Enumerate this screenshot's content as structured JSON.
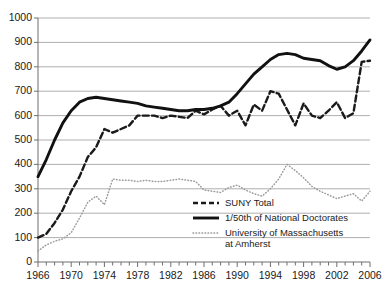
{
  "chart_data": {
    "type": "line",
    "title": "",
    "xlabel": "",
    "ylabel": "",
    "xlim": [
      1966,
      2006
    ],
    "ylim": [
      0,
      1000
    ],
    "grid": true,
    "legend_position": "bottom-right",
    "ytick_labels": [
      "0",
      "100",
      "200",
      "300",
      "400",
      "500",
      "600",
      "700",
      "800",
      "900",
      "1000"
    ],
    "ytick_values": [
      0,
      100,
      200,
      300,
      400,
      500,
      600,
      700,
      800,
      900,
      1000
    ],
    "xtick_labels": [
      "1966",
      "1970",
      "1974",
      "1978",
      "1982",
      "1986",
      "1990",
      "1994",
      "1998",
      "2002",
      "2006"
    ],
    "xtick_values": [
      1966,
      1970,
      1974,
      1978,
      1982,
      1986,
      1990,
      1994,
      1998,
      2002,
      2006
    ],
    "x": [
      1966,
      1967,
      1968,
      1969,
      1970,
      1971,
      1972,
      1973,
      1974,
      1975,
      1976,
      1977,
      1978,
      1979,
      1980,
      1981,
      1982,
      1983,
      1984,
      1985,
      1986,
      1987,
      1988,
      1989,
      1990,
      1991,
      1992,
      1993,
      1994,
      1995,
      1996,
      1997,
      1998,
      1999,
      2000,
      2001,
      2002,
      2003,
      2004,
      2005,
      2006
    ],
    "series": [
      {
        "name": "SUNY Total",
        "style": "dashed",
        "color": "#1a1a1a",
        "values": [
          100,
          115,
          160,
          215,
          290,
          350,
          430,
          470,
          545,
          530,
          545,
          560,
          600,
          600,
          600,
          590,
          600,
          595,
          590,
          620,
          605,
          625,
          640,
          600,
          620,
          560,
          645,
          620,
          700,
          690,
          625,
          560,
          650,
          600,
          590,
          620,
          655,
          590,
          610,
          820,
          825
        ]
      },
      {
        "name": "1/50th of National Doctorates",
        "style": "solid",
        "color": "#111111",
        "values": [
          350,
          420,
          500,
          570,
          620,
          655,
          670,
          675,
          670,
          665,
          660,
          655,
          650,
          640,
          635,
          630,
          625,
          620,
          620,
          625,
          625,
          630,
          640,
          655,
          690,
          730,
          770,
          800,
          830,
          850,
          855,
          850,
          835,
          830,
          825,
          805,
          790,
          800,
          825,
          865,
          910
        ]
      },
      {
        "name": "University of Massachusetts at Amherst",
        "style": "dotted",
        "color": "#9a9a9a",
        "values": [
          45,
          70,
          85,
          95,
          120,
          180,
          245,
          270,
          235,
          340,
          335,
          335,
          330,
          335,
          330,
          330,
          335,
          340,
          335,
          330,
          295,
          290,
          285,
          305,
          315,
          295,
          280,
          270,
          300,
          340,
          400,
          375,
          345,
          310,
          290,
          275,
          260,
          270,
          280,
          250,
          290
        ]
      }
    ]
  },
  "legend": {
    "items": [
      {
        "label": "SUNY Total",
        "style": "dashed"
      },
      {
        "label": "1/50th of National Doctorates",
        "style": "solid"
      },
      {
        "label": "University of Massachusetts",
        "label2": "at Amherst",
        "style": "dotted"
      }
    ]
  },
  "colors": {
    "grid": "#8d8d8d",
    "axis": "#6f6f6f",
    "solid_series": "#111111",
    "dashed_series": "#1a1a1a",
    "dotted_series": "#9a9a9a",
    "text": "#1a1a1a"
  }
}
